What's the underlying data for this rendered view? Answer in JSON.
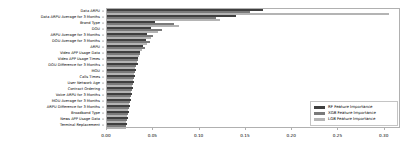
{
  "chart_data": {
    "type": "bar",
    "orientation": "horizontal",
    "title": "",
    "xlabel": "",
    "ylabel": "",
    "xlim": [
      0.0,
      0.3175
    ],
    "xticks": [
      0.0,
      0.05,
      0.1,
      0.15,
      0.2,
      0.25,
      0.3
    ],
    "xticklabels": [
      "0.00",
      "0.05",
      "0.10",
      "0.15",
      "0.20",
      "0.25",
      "0.30"
    ],
    "grid": false,
    "legend_position": "lower right",
    "categories": [
      "Data ARPU",
      "Data ARPU Average for 3 Months",
      "Brand Type",
      "DOU",
      "ARPU Average for 3 Months",
      "DOU Average for 3 Months",
      "ARPU",
      "Video APP Usage Data",
      "Video APP Usage Times",
      "DOU Difference for 3 Months",
      "MOU",
      "Calls Times",
      "User Network Age",
      "Contract Ordering",
      "Voice ARPU for 3 Months",
      "MOU Average for 3 Months",
      "ARPU Difference for 3 Months",
      "Broadband Type",
      "News APP Usage Data",
      "Terminal Replacement"
    ],
    "series": [
      {
        "name": "RF Feature Importance",
        "color": "#3f3f3f",
        "values": [
          0.168,
          0.139,
          0.052,
          0.047,
          0.043,
          0.042,
          0.039,
          0.036,
          0.034,
          0.033,
          0.031,
          0.03,
          0.029,
          0.028,
          0.027,
          0.026,
          0.025,
          0.024,
          0.023,
          0.022
        ]
      },
      {
        "name": "XGB Feature Importance",
        "color": "#7a7a7a",
        "values": [
          0.154,
          0.118,
          0.072,
          0.059,
          0.05,
          0.046,
          0.041,
          0.036,
          0.033,
          0.031,
          0.03,
          0.029,
          0.028,
          0.027,
          0.026,
          0.025,
          0.024,
          0.023,
          0.022,
          0.021
        ]
      },
      {
        "name": "LGB Feature Importance",
        "color": "#b4b4b4",
        "values": [
          0.305,
          0.122,
          0.078,
          0.055,
          0.048,
          0.043,
          0.038,
          0.035,
          0.032,
          0.03,
          0.029,
          0.028,
          0.027,
          0.026,
          0.025,
          0.024,
          0.023,
          0.022,
          0.021,
          0.02
        ]
      }
    ]
  },
  "legend": {
    "items": [
      {
        "label": "RF Feature Importance",
        "key": "rf"
      },
      {
        "label": "XGB Feature Importance",
        "key": "xgb"
      },
      {
        "label": "LGB Feature Importance",
        "key": "lgb"
      }
    ]
  }
}
